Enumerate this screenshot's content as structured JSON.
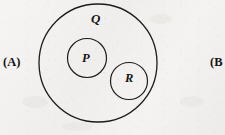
{
  "figure": {
    "type": "euler-diagram",
    "background_color": "#f3f2f0",
    "stroke_color": "#1d1c1a",
    "sets": [
      {
        "id": "q",
        "label": "Q",
        "role": "outer-set",
        "cx": 98,
        "cy": 63,
        "r": 59,
        "stroke_width": 1.3,
        "label_x": 97,
        "label_y": 21
      },
      {
        "id": "p",
        "label": "P",
        "role": "inner-subset",
        "cx": 87,
        "cy": 58,
        "r": 19.5,
        "stroke_width": 1.2,
        "label_x": 87,
        "label_y": 59
      },
      {
        "id": "r",
        "label": "R",
        "role": "inner-subset",
        "cx": 129,
        "cy": 81,
        "r": 18.5,
        "stroke_width": 1.2,
        "label_x": 130,
        "label_y": 79
      }
    ]
  },
  "options": {
    "left": "(A)",
    "right": "(B"
  }
}
